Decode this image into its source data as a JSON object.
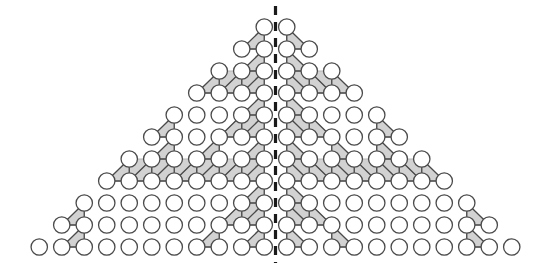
{
  "figure": {
    "type": "diagram",
    "background_color": "#ffffff",
    "width": 551,
    "height": 269
  },
  "geometry": {
    "rows": 11,
    "circles_in_row_formula": "2 * row_index",
    "total_circles": 132,
    "apex_row_count": 2,
    "bottom_row_count": 22,
    "column_spacing": 22.5,
    "row_spacing": 22,
    "circle_radius": 8.2,
    "origin_x": 28,
    "origin_y": 247,
    "apex_y": 27
  },
  "style": {
    "circle_fill": "#ffffff",
    "circle_stroke": "#4a4a4a",
    "circle_stroke_width": 1.3,
    "edge_stroke": "#4a4a4a",
    "edge_stroke_width": 1.3,
    "shade_fill": "#d2d2d2",
    "shade_stroke": "#b4b4b4",
    "axis_line_color": "#1a1a1a",
    "axis_line_width": 3.2,
    "axis_dash": "9 7"
  },
  "symmetry_axis": {
    "label": "vertical mirror axis",
    "x": 275.5,
    "y_top": 6,
    "y_bottom": 263,
    "dashed": true
  },
  "shaded_blocks": [
    {
      "name": "block-L1",
      "row_top": 6,
      "col_left": 0,
      "size": 5,
      "orientation": "left-triangle"
    },
    {
      "name": "block-L2",
      "row_top": 6,
      "col_left": 5,
      "size": 5,
      "orientation": "left-triangle"
    },
    {
      "name": "block-L3",
      "row_top": 1,
      "col_left": 0,
      "size": 5,
      "orientation": "left-triangle"
    },
    {
      "name": "block-R1",
      "row_top": 6,
      "col_left": 0,
      "size": 5,
      "orientation": "right-triangle"
    },
    {
      "name": "block-R2",
      "row_top": 6,
      "col_left": 5,
      "size": 5,
      "orientation": "right-triangle"
    },
    {
      "name": "block-R3",
      "row_top": 1,
      "col_left": 0,
      "size": 5,
      "orientation": "right-triangle"
    }
  ],
  "legend": {
    "present": false,
    "entries": []
  },
  "labels": {
    "present": false,
    "texts": []
  }
}
